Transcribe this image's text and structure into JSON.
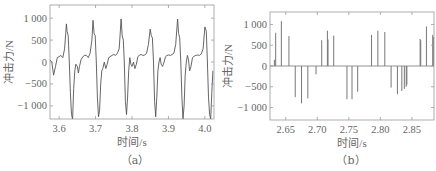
{
  "chart_data": [
    {
      "id": "a",
      "type": "line",
      "caption": "（a）",
      "xlabel": "时间/s",
      "ylabel": "冲击力/N",
      "xlim": [
        3.575,
        4.025
      ],
      "ylim": [
        -1300,
        1300
      ],
      "xticks": [
        3.6,
        3.7,
        3.8,
        3.9,
        4.0
      ],
      "xtick_labels": [
        "3.6",
        "3.7",
        "3.8",
        "3.9",
        "4.0"
      ],
      "yticks": [
        1000,
        500,
        0,
        -500,
        -1000
      ],
      "ytick_labels": [
        "1 000",
        "500",
        "0",
        "−500",
        "−1 000"
      ],
      "grid": false,
      "series": [
        {
          "name": "impact force",
          "x": [
            3.575,
            3.58,
            3.585,
            3.59,
            3.595,
            3.6,
            3.605,
            3.61,
            3.615,
            3.618,
            3.62,
            3.622,
            3.625,
            3.628,
            3.631,
            3.634,
            3.637,
            3.64,
            3.643,
            3.646,
            3.65,
            3.653,
            3.656,
            3.66,
            3.665,
            3.67,
            3.675,
            3.68,
            3.685,
            3.69,
            3.693,
            3.696,
            3.699,
            3.702,
            3.705,
            3.708,
            3.711,
            3.714,
            3.717,
            3.72,
            3.724,
            3.728,
            3.732,
            3.736,
            3.74,
            3.745,
            3.75,
            3.755,
            3.76,
            3.765,
            3.77,
            3.773,
            3.776,
            3.779,
            3.782,
            3.785,
            3.788,
            3.791,
            3.794,
            3.797,
            3.8,
            3.804,
            3.808,
            3.812,
            3.816,
            3.82,
            3.825,
            3.83,
            3.835,
            3.84,
            3.845,
            3.85,
            3.853,
            3.856,
            3.859,
            3.862,
            3.865,
            3.868,
            3.871,
            3.874,
            3.877,
            3.88,
            3.884,
            3.888,
            3.892,
            3.896,
            3.9,
            3.905,
            3.91,
            3.915,
            3.92,
            3.925,
            3.928,
            3.931,
            3.934,
            3.937,
            3.94,
            3.943,
            3.946,
            3.949,
            3.952,
            3.955,
            3.958,
            3.962,
            3.966,
            3.97,
            3.975,
            3.98,
            3.985,
            3.99,
            3.995,
            4.0,
            4.004,
            4.007,
            4.01,
            4.013,
            4.016,
            4.019,
            4.022,
            4.025
          ],
          "y": [
            50,
            0,
            -300,
            -100,
            100,
            120,
            150,
            100,
            300,
            650,
            870,
            700,
            600,
            0,
            -700,
            -1200,
            -1300,
            -600,
            -200,
            -50,
            -100,
            -250,
            -100,
            50,
            120,
            150,
            150,
            100,
            200,
            500,
            950,
            650,
            600,
            0,
            -800,
            -1250,
            -1100,
            -500,
            -200,
            -150,
            0,
            -150,
            -50,
            100,
            120,
            150,
            170,
            150,
            200,
            300,
            980,
            600,
            500,
            0,
            -900,
            -1200,
            -800,
            -200,
            100,
            -50,
            -100,
            0,
            -150,
            -50,
            120,
            150,
            170,
            150,
            160,
            200,
            400,
            750,
            600,
            550,
            0,
            -900,
            -1250,
            -800,
            -200,
            0,
            100,
            -50,
            -100,
            0,
            120,
            150,
            160,
            150,
            170,
            200,
            400,
            980,
            650,
            550,
            0,
            -800,
            -1300,
            -1000,
            -300,
            0,
            150,
            50,
            -200,
            -100,
            100,
            130,
            150,
            160,
            150,
            180,
            300,
            800,
            700,
            0,
            -800,
            -1200,
            -1300,
            -700,
            -200
          ]
        }
      ]
    },
    {
      "id": "b",
      "type": "bar",
      "caption": "（b）",
      "xlabel": "时间/s",
      "ylabel": "冲击力/N",
      "xlim": [
        2.625,
        2.885
      ],
      "ylim": [
        -1300,
        1300
      ],
      "xticks": [
        2.65,
        2.7,
        2.75,
        2.8,
        2.85
      ],
      "xtick_labels": [
        "2.65",
        "2.70",
        "2.75",
        "2.80",
        "2.85"
      ],
      "yticks": [
        1000,
        500,
        0,
        -500,
        -1000
      ],
      "ytick_labels": [
        "1 000",
        "500",
        "0",
        "−500",
        "−1 000"
      ],
      "grid": false,
      "series": [
        {
          "name": "impact force (impulses)",
          "x": [
            2.632,
            2.634,
            2.643,
            2.655,
            2.665,
            2.675,
            2.685,
            2.698,
            2.707,
            2.716,
            2.717,
            2.726,
            2.747,
            2.755,
            2.764,
            2.786,
            2.796,
            2.807,
            2.817,
            2.827,
            2.834,
            2.838,
            2.841,
            2.842,
            2.863,
            2.864,
            2.873,
            2.883,
            2.884
          ],
          "values": [
            150,
            800,
            1080,
            720,
            -750,
            -900,
            -780,
            -200,
            620,
            850,
            640,
            730,
            -800,
            -800,
            -620,
            750,
            850,
            820,
            -520,
            -680,
            -600,
            -550,
            -500,
            -450,
            650,
            620,
            950,
            750,
            700
          ]
        }
      ]
    }
  ]
}
